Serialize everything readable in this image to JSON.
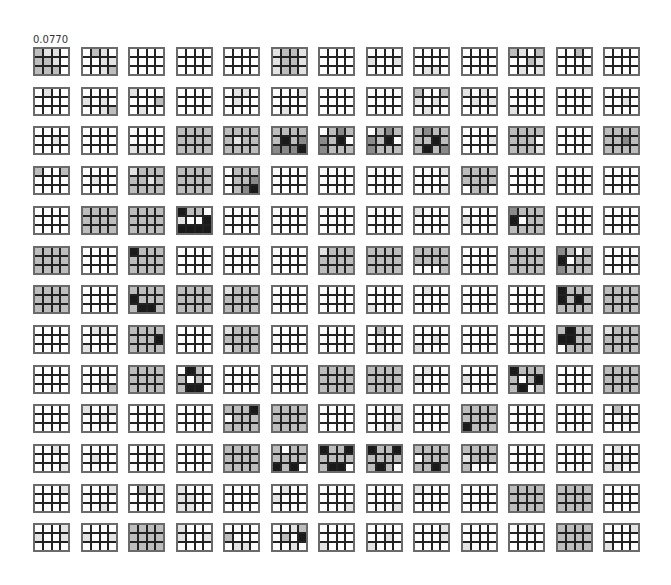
{
  "figure": {
    "label": "0.0770",
    "rows": 13,
    "cols": 13,
    "block_cols": 4,
    "block_rows": 3,
    "origin_x": 33,
    "origin_y": 47,
    "pitch_x": 47.5,
    "pitch_y": 39.7,
    "shade_colors": [
      "#ffffff",
      "#e3e3e3",
      "#bdbdbd",
      "#8a8a8a",
      "#1a1a1a"
    ],
    "shade_legend": "0 = white, 4 = black",
    "blocks": [
      [
        [
          "211",
          "221",
          "222"
        ],
        [
          "0210",
          "0011",
          "0012"
        ],
        [
          "0000",
          "0000",
          "0000"
        ],
        [
          "0000",
          "0000",
          "0000"
        ],
        [
          "0000",
          "0000",
          "0000"
        ],
        [
          "1221",
          "1221",
          "1221"
        ],
        [
          "0000",
          "0000",
          "0000"
        ],
        [
          "0000",
          "1001",
          "0000"
        ],
        [
          "0000",
          "0000",
          "0110"
        ],
        [
          "0000",
          "0000",
          "0000"
        ],
        [
          "2102",
          "0021",
          "0101"
        ],
        [
          "0020",
          "0000",
          "0001"
        ],
        [
          "0000",
          "0000",
          "0000"
        ],
        [
          "0000",
          "0010",
          "0000"
        ]
      ],
      [
        [
          "0100",
          "0000",
          "0000"
        ],
        [
          "0000",
          "1010",
          "0012"
        ],
        [
          "1000",
          "0002",
          "0100"
        ],
        [
          "0000",
          "0000",
          "0000"
        ],
        [
          "0110",
          "0100",
          "0000"
        ],
        [
          "0001",
          "0000",
          "0100"
        ],
        [
          "0000",
          "0000",
          "0000"
        ],
        [
          "0000",
          "0000",
          "0000"
        ],
        [
          "2002",
          "1010",
          "0100"
        ],
        [
          "1010",
          "0101",
          "0000"
        ],
        [
          "0000",
          "0000",
          "1000"
        ],
        [
          "0000",
          "0000",
          "0000"
        ],
        [
          "0000",
          "0010",
          "0000"
        ],
        [
          "2222",
          "2232",
          "2222"
        ]
      ],
      [
        [
          "0000",
          "0010",
          "0000"
        ],
        [
          "0000",
          "0000",
          "0000"
        ],
        [
          "0000",
          "0000",
          "1110"
        ],
        [
          "2222",
          "2222",
          "2222"
        ],
        [
          "2222",
          "2122",
          "2222"
        ],
        [
          "2222",
          "2423",
          "3334"
        ],
        [
          "0232",
          "3240",
          "3222"
        ],
        [
          "0232",
          "3240",
          "3222"
        ],
        [
          "2322",
          "2242",
          "2423"
        ],
        [
          "0000",
          "0001",
          "0000"
        ],
        [
          "2222",
          "2220",
          "2221"
        ],
        [
          "0000",
          "0000",
          "0000"
        ],
        [
          "2222",
          "2232",
          "2222"
        ],
        [
          "0000",
          "0000",
          "0000"
        ]
      ],
      [
        [
          "2002",
          "0000",
          "0000"
        ],
        [
          "0000",
          "0100",
          "0000"
        ],
        [
          "1222",
          "2212",
          "2222"
        ],
        [
          "2222",
          "2222",
          "2222"
        ],
        [
          "0222",
          "0223",
          "0234"
        ],
        [
          "0000",
          "0000",
          "0000"
        ],
        [
          "0000",
          "0000",
          "0000"
        ],
        [
          "0000",
          "0000",
          "0000"
        ],
        [
          "0001",
          "0000",
          "0001"
        ],
        [
          "2222",
          "2222",
          "0220"
        ],
        [
          "0000",
          "0000",
          "0000"
        ],
        [
          "0000",
          "0000",
          "0000"
        ],
        [
          "0000",
          "0000",
          "0000"
        ],
        [
          "0001",
          "0001",
          "1100"
        ]
      ],
      [
        [
          "0000",
          "0000",
          "0000"
        ],
        [
          "2222",
          "2222",
          "2222"
        ],
        [
          "2222",
          "2222",
          "2222"
        ],
        [
          "4220",
          "1004",
          "4444"
        ],
        [
          "0000",
          "0000",
          "0000"
        ],
        [
          "0000",
          "0000",
          "0000"
        ],
        [
          "0000",
          "0000",
          "0000"
        ],
        [
          "0000",
          "0000",
          "0000"
        ],
        [
          "1000",
          "0000",
          "0000"
        ],
        [
          "0000",
          "1000",
          "0000"
        ],
        [
          "3222",
          "4022",
          "2222"
        ],
        [
          "0000",
          "0000",
          "0000"
        ],
        [
          "0000",
          "0000",
          "0000"
        ],
        [
          "0000",
          "0000",
          "0000"
        ]
      ],
      [
        [
          "2222",
          "2222",
          "2222"
        ],
        [
          "0000",
          "0000",
          "0000"
        ],
        [
          "4222",
          "2222",
          "2222"
        ],
        [
          "0000",
          "0000",
          "0000"
        ],
        [
          "0000",
          "0000",
          "0000"
        ],
        [
          "0000",
          "0000",
          "0000"
        ],
        [
          "1222",
          "2222",
          "2222"
        ],
        [
          "2222",
          "2222",
          "2222"
        ],
        [
          "2222",
          "2222",
          "0002"
        ],
        [
          "0000",
          "0000",
          "0000"
        ],
        [
          "2222",
          "2222",
          "2222"
        ],
        [
          "3202",
          "4022",
          "3222"
        ],
        [
          "0000",
          "0001",
          "0000"
        ],
        [
          "0000",
          "1010",
          "0000"
        ]
      ],
      [
        [
          "2222",
          "2222",
          "2222"
        ],
        [
          "0000",
          "0000",
          "0000"
        ],
        [
          "2222",
          "4222",
          "2442"
        ],
        [
          "2222",
          "2222",
          "2222"
        ],
        [
          "1222",
          "2222",
          "2222"
        ],
        [
          "0000",
          "0000",
          "0000"
        ],
        [
          "0000",
          "0000",
          "0000"
        ],
        [
          "0000",
          "0000",
          "1000"
        ],
        [
          "0100",
          "0000",
          "0000"
        ],
        [
          "0000",
          "0000",
          "0000"
        ],
        [
          "0000",
          "0000",
          "0000"
        ],
        [
          "4222",
          "4242",
          "2222"
        ],
        [
          "2222",
          "2222",
          "2222"
        ],
        [
          "0000",
          "0000",
          "0000"
        ]
      ],
      [
        [
          "0000",
          "0000",
          "0000"
        ],
        [
          "0110",
          "0000",
          "1000"
        ],
        [
          "2222",
          "2224",
          "2222"
        ],
        [
          "0000",
          "0000",
          "0000"
        ],
        [
          "1222",
          "2222",
          "1222"
        ],
        [
          "0000",
          "0000",
          "0000"
        ],
        [
          "0000",
          "0000",
          "0000"
        ],
        [
          "0200",
          "0000",
          "0100"
        ],
        [
          "0000",
          "0010",
          "1000"
        ],
        [
          "0000",
          "0000",
          "0000"
        ],
        [
          "0000",
          "0000",
          "0000"
        ],
        [
          "2422",
          "4422",
          "0222"
        ],
        [
          "1222",
          "2222",
          "2222"
        ],
        [
          "0000",
          "0000",
          "0000"
        ]
      ],
      [
        [
          "0000",
          "0000",
          "0000"
        ],
        [
          "0000",
          "0010",
          "0002"
        ],
        [
          "2222",
          "2222",
          "2222"
        ],
        [
          "0420",
          "2020",
          "2440"
        ],
        [
          "0000",
          "0000",
          "0000"
        ],
        [
          "0000",
          "0000",
          "0000"
        ],
        [
          "2222",
          "2222",
          "2222"
        ],
        [
          "2222",
          "2222",
          "2222"
        ],
        [
          "0100",
          "1000",
          "0000"
        ],
        [
          "0000",
          "1000",
          "0000"
        ],
        [
          "4222",
          "2024",
          "2402"
        ],
        [
          "0000",
          "0000",
          "0000"
        ],
        [
          "2222",
          "2222",
          "2222"
        ],
        [
          "2222",
          "2222",
          "2222"
        ]
      ],
      [
        [
          "0000",
          "0000",
          "0000"
        ],
        [
          "1001",
          "0010",
          "0000"
        ],
        [
          "0000",
          "0000",
          "0000"
        ],
        [
          "0000",
          "0000",
          "0000"
        ],
        [
          "2224",
          "0222",
          "2222"
        ],
        [
          "2222",
          "2222",
          "2222"
        ],
        [
          "0000",
          "0000",
          "0000"
        ],
        [
          "0001",
          "0001",
          "0011"
        ],
        [
          "0000",
          "0000",
          "0000"
        ],
        [
          "2222",
          "2222",
          "4222"
        ],
        [
          "0000",
          "0000",
          "0000"
        ],
        [
          "0000",
          "0000",
          "0000"
        ],
        [
          "0200",
          "0010",
          "0000"
        ],
        [
          "0000",
          "1000",
          "0010"
        ]
      ],
      [
        [
          "0010",
          "0000",
          "0001"
        ],
        [
          "0000",
          "0100",
          "0000"
        ],
        [
          "0000",
          "0010",
          "0000"
        ],
        [
          "0000",
          "0000",
          "0000"
        ],
        [
          "2222",
          "2222",
          "2222"
        ],
        [
          "2022",
          "2222",
          "4240"
        ],
        [
          "4224",
          "2222",
          "2440"
        ],
        [
          "4224",
          "2222",
          "2420"
        ],
        [
          "2222",
          "0222",
          "2242"
        ],
        [
          "2222",
          "1222",
          "2000"
        ],
        [
          "0000",
          "0000",
          "0000"
        ],
        [
          "0000",
          "0000",
          "0000"
        ],
        [
          "0100",
          "0010",
          "1100"
        ],
        [
          "0000",
          "0000",
          "0000"
        ]
      ],
      [
        [
          "0001",
          "0000",
          "0000"
        ],
        [
          "0001",
          "0000",
          "0010"
        ],
        [
          "0201",
          "0010",
          "0000"
        ],
        [
          "1000",
          "1100",
          "1100"
        ],
        [
          "0000",
          "0000",
          "0000"
        ],
        [
          "0100",
          "1000",
          "0000"
        ],
        [
          "0000",
          "0000",
          "0001"
        ],
        [
          "0000",
          "0000",
          "0001"
        ],
        [
          "1000",
          "0000",
          "0000"
        ],
        [
          "0000",
          "0000",
          "0000"
        ],
        [
          "2222",
          "2222",
          "2222"
        ],
        [
          "2222",
          "2222",
          "2222"
        ],
        [
          "0000",
          "0000",
          "0000"
        ],
        [
          "2222",
          "2222",
          "2222"
        ]
      ],
      [
        [
          "0001",
          "1001",
          "0000"
        ],
        [
          "0000",
          "1001",
          "0000"
        ],
        [
          "2222",
          "2222",
          "2222"
        ],
        [
          "1000",
          "1001",
          "0000"
        ],
        [
          "0000",
          "2000",
          "0110"
        ],
        [
          "0012",
          "0204",
          "0010"
        ],
        [
          "0000",
          "0000",
          "1000"
        ],
        [
          "0000",
          "0010",
          "1000"
        ],
        [
          "0001",
          "0001",
          "0000"
        ],
        [
          "0000",
          "0000",
          "1000"
        ],
        [
          "0010",
          "0000",
          "0000"
        ],
        [
          "2222",
          "2222",
          "2222"
        ],
        [
          "0001",
          "0000",
          "1000"
        ],
        [
          "0000",
          "0001",
          "0000"
        ]
      ]
    ]
  }
}
